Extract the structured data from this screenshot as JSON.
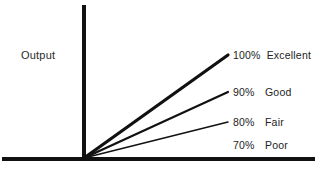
{
  "figure": {
    "background_color": "#ffffff",
    "ink_color": "#111111",
    "width": 318,
    "height": 169,
    "axis_label_output": "Output"
  },
  "chart_data": {
    "type": "line",
    "title": "",
    "subtitle": "",
    "xlabel": "",
    "ylabel": "Output",
    "grid": false,
    "legend_position": "right-inline",
    "origin": {
      "x": 84,
      "y": 158
    },
    "x_axis": {
      "from_px": 2,
      "to_px": 315,
      "y_px": 159,
      "thickness_px": 4,
      "ticks": [],
      "ticklabels": []
    },
    "y_axis": {
      "from_px": 159,
      "to_px": 5,
      "x_px": 84,
      "thickness_px": 4,
      "ticks": [],
      "ticklabels": []
    },
    "categories": [
      "100%",
      "90%",
      "80%",
      "70%"
    ],
    "values": [
      100,
      90,
      80,
      70
    ],
    "series": [
      {
        "name": "100% Excellent",
        "percent_label": "100%",
        "rating_label": "Excellent",
        "value": 100,
        "slope_endpoint": {
          "x": 228,
          "y": 55
        },
        "line_width": 3.2,
        "color": "#111111"
      },
      {
        "name": "90% Good",
        "percent_label": "90%",
        "rating_label": "Good",
        "value": 90,
        "slope_endpoint": {
          "x": 228,
          "y": 92
        },
        "line_width": 2.2,
        "color": "#111111"
      },
      {
        "name": "80% Fair",
        "percent_label": "80%",
        "rating_label": "Fair",
        "value": 80,
        "slope_endpoint": {
          "x": 228,
          "y": 122
        },
        "line_width": 1.5,
        "color": "#111111"
      },
      {
        "name": "70% Poor",
        "percent_label": "70%",
        "rating_label": "Poor",
        "value": 70,
        "slope_endpoint": null,
        "line_width": 0,
        "color": "#111111"
      }
    ],
    "annotations": [
      {
        "text": "Output",
        "x": 21,
        "y": 57
      },
      {
        "text": "100% Excellent",
        "x": 233,
        "y": 57
      },
      {
        "text": "90%  Good",
        "x": 233,
        "y": 94
      },
      {
        "text": "80%  Fair",
        "x": 233,
        "y": 124
      },
      {
        "text": "70%  Poor",
        "x": 233,
        "y": 147
      }
    ]
  }
}
